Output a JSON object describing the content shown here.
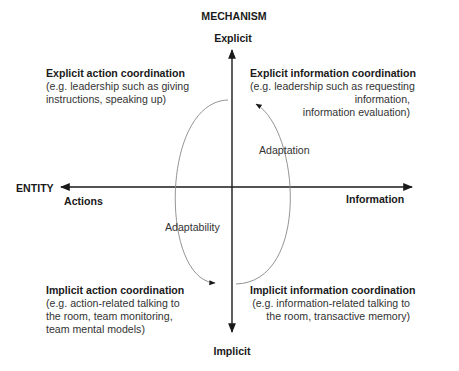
{
  "diagram": {
    "vertical_axis": {
      "title": "MECHANISM",
      "top_label": "Explicit",
      "bottom_label": "Implicit"
    },
    "horizontal_axis": {
      "title": "ENTITY",
      "left_label": "Actions",
      "right_label": "Information"
    },
    "quadrants": {
      "top_left": {
        "title": "Explicit action coordination",
        "lines": [
          "(e.g. leadership such as giving",
          "instructions, speaking up)"
        ]
      },
      "top_right": {
        "title": "Explicit information coordination",
        "lines": [
          "(e.g. leadership such as requesting",
          "information,",
          "information evaluation)"
        ]
      },
      "bottom_left": {
        "title": "Implicit action coordination",
        "lines": [
          "(e.g. action-related talking to",
          "the room, team monitoring,",
          "team mental models)"
        ]
      },
      "bottom_right": {
        "title": "Implicit information coordination",
        "lines": [
          "(e.g. information-related talking to",
          "the room, transactive memory)"
        ]
      }
    },
    "cycle": {
      "left_arc_label": "Adaptability",
      "right_arc_label": "Adaptation"
    },
    "colors": {
      "axis": "#1a1a1a",
      "arc": "#888888",
      "text": "#222222"
    }
  }
}
